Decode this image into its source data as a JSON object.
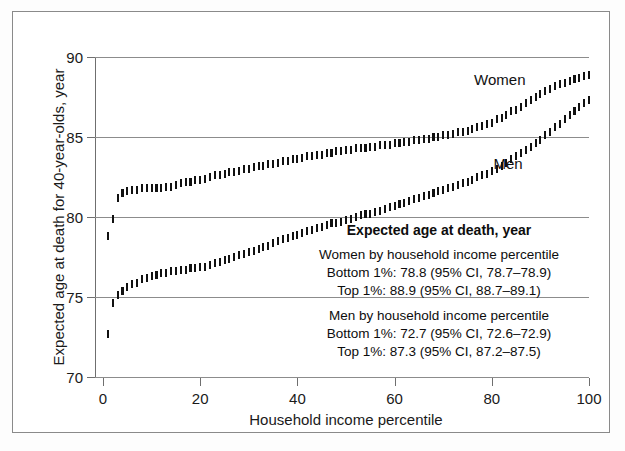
{
  "chart_data": {
    "type": "scatter",
    "title": "",
    "xlabel": "Household income percentile",
    "ylabel": "Expected age at death for 40-year-olds, year",
    "xlim": [
      0,
      100
    ],
    "ylim": [
      70,
      90
    ],
    "xticks": [
      0,
      20,
      40,
      60,
      80,
      100
    ],
    "yticks": [
      70,
      75,
      80,
      85,
      90
    ],
    "grid": true,
    "legend_position": "inline-annotations",
    "marker_style": "vertical-ci-bar",
    "series": [
      {
        "name": "Women",
        "label_text": "Women",
        "color": "#111111",
        "x": [
          1,
          2,
          3,
          4,
          5,
          6,
          7,
          8,
          9,
          10,
          11,
          12,
          13,
          14,
          15,
          16,
          17,
          18,
          19,
          20,
          21,
          22,
          23,
          24,
          25,
          26,
          27,
          28,
          29,
          30,
          31,
          32,
          33,
          34,
          35,
          36,
          37,
          38,
          39,
          40,
          41,
          42,
          43,
          44,
          45,
          46,
          47,
          48,
          49,
          50,
          51,
          52,
          53,
          54,
          55,
          56,
          57,
          58,
          59,
          60,
          61,
          62,
          63,
          64,
          65,
          66,
          67,
          68,
          69,
          70,
          71,
          72,
          73,
          74,
          75,
          76,
          77,
          78,
          79,
          80,
          81,
          82,
          83,
          84,
          85,
          86,
          87,
          88,
          89,
          90,
          91,
          92,
          93,
          94,
          95,
          96,
          97,
          98,
          99,
          100
        ],
        "y": [
          78.8,
          79.9,
          81.2,
          81.5,
          81.6,
          81.7,
          81.7,
          81.8,
          81.8,
          81.8,
          81.8,
          81.8,
          81.9,
          81.9,
          82.0,
          82.1,
          82.2,
          82.2,
          82.3,
          82.3,
          82.4,
          82.5,
          82.6,
          82.6,
          82.7,
          82.8,
          82.8,
          82.9,
          83.0,
          83.0,
          83.1,
          83.2,
          83.2,
          83.3,
          83.3,
          83.4,
          83.5,
          83.5,
          83.6,
          83.6,
          83.7,
          83.8,
          83.8,
          83.9,
          83.9,
          84.0,
          84.0,
          84.1,
          84.1,
          84.2,
          84.2,
          84.3,
          84.3,
          84.3,
          84.4,
          84.4,
          84.5,
          84.5,
          84.5,
          84.6,
          84.6,
          84.7,
          84.7,
          84.8,
          84.8,
          84.9,
          84.9,
          85.0,
          85.0,
          85.1,
          85.1,
          85.2,
          85.3,
          85.3,
          85.4,
          85.5,
          85.6,
          85.7,
          85.8,
          85.9,
          86.1,
          86.2,
          86.4,
          86.6,
          86.7,
          86.9,
          87.1,
          87.3,
          87.5,
          87.7,
          87.9,
          88.0,
          88.2,
          88.3,
          88.4,
          88.5,
          88.6,
          88.7,
          88.8,
          88.9
        ]
      },
      {
        "name": "Men",
        "label_text": "Men",
        "color": "#111111",
        "x": [
          1,
          2,
          3,
          4,
          5,
          6,
          7,
          8,
          9,
          10,
          11,
          12,
          13,
          14,
          15,
          16,
          17,
          18,
          19,
          20,
          21,
          22,
          23,
          24,
          25,
          26,
          27,
          28,
          29,
          30,
          31,
          32,
          33,
          34,
          35,
          36,
          37,
          38,
          39,
          40,
          41,
          42,
          43,
          44,
          45,
          46,
          47,
          48,
          49,
          50,
          51,
          52,
          53,
          54,
          55,
          56,
          57,
          58,
          59,
          60,
          61,
          62,
          63,
          64,
          65,
          66,
          67,
          68,
          69,
          70,
          71,
          72,
          73,
          74,
          75,
          76,
          77,
          78,
          79,
          80,
          81,
          82,
          83,
          84,
          85,
          86,
          87,
          88,
          89,
          90,
          91,
          92,
          93,
          94,
          95,
          96,
          97,
          98,
          99,
          100
        ],
        "y": [
          72.7,
          74.6,
          75.1,
          75.4,
          75.6,
          75.8,
          75.9,
          76.1,
          76.2,
          76.3,
          76.4,
          76.5,
          76.5,
          76.6,
          76.6,
          76.7,
          76.7,
          76.8,
          76.8,
          76.9,
          76.9,
          77.0,
          77.1,
          77.2,
          77.3,
          77.4,
          77.5,
          77.6,
          77.7,
          77.8,
          77.9,
          78.0,
          78.1,
          78.2,
          78.4,
          78.5,
          78.6,
          78.7,
          78.8,
          78.9,
          79.0,
          79.1,
          79.2,
          79.3,
          79.4,
          79.5,
          79.6,
          79.6,
          79.7,
          79.8,
          79.9,
          80.0,
          80.1,
          80.2,
          80.2,
          80.3,
          80.4,
          80.5,
          80.6,
          80.7,
          80.8,
          80.9,
          81.0,
          81.1,
          81.2,
          81.3,
          81.4,
          81.5,
          81.6,
          81.7,
          81.8,
          81.9,
          82.0,
          82.1,
          82.2,
          82.3,
          82.5,
          82.6,
          82.7,
          82.9,
          83.0,
          83.2,
          83.4,
          83.6,
          83.8,
          84.0,
          84.2,
          84.4,
          84.6,
          84.8,
          85.1,
          85.3,
          85.6,
          85.8,
          86.1,
          86.4,
          86.6,
          86.9,
          87.1,
          87.3
        ]
      }
    ]
  },
  "axes": {
    "y_title": "Expected age at death for 40-year-olds, year",
    "x_title": "Household income percentile",
    "y_tick_labels": [
      "70",
      "75",
      "80",
      "85",
      "90"
    ],
    "x_tick_labels": [
      "0",
      "20",
      "40",
      "60",
      "80",
      "100"
    ]
  },
  "series_labels": {
    "women": "Women",
    "men": "Men"
  },
  "annotation": {
    "heading": "Expected age at death, year",
    "women_group_title": "Women by household income percentile",
    "women_bottom": "Bottom 1%: 78.8 (95% CI, 78.7–78.9)",
    "women_top": "Top 1%: 88.9 (95% CI, 88.7–89.1)",
    "men_group_title": "Men by household income percentile",
    "men_bottom": "Bottom 1%: 72.7 (95% CI, 72.6–72.9)",
    "men_top": "Top 1%: 87.3 (95% CI, 87.2–87.5)"
  },
  "colors": {
    "marker": "#111111",
    "gridline": "#8c8c8c",
    "axis": "#6f6f6f",
    "frame": "#8a8a8a",
    "background": "#ffffff"
  }
}
